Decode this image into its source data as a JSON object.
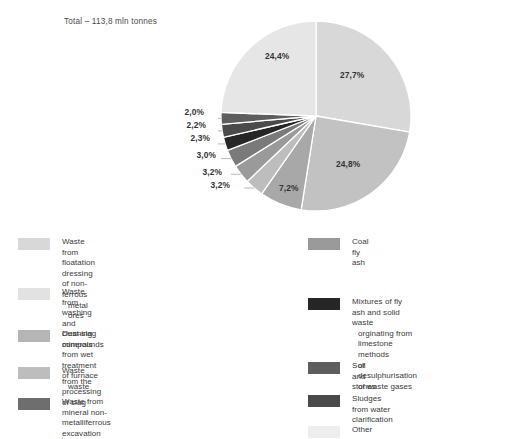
{
  "chart_data": {
    "type": "pie",
    "title": "Total – 113,8 mln tonnes",
    "total_label": "Total – 113,8 mln tonnes",
    "total_value": 113.8,
    "unit": "mln tonnes",
    "value_suffix": "%",
    "decimal_separator": ",",
    "legend_position": "bottom",
    "grid": false,
    "categories": [
      "Waste from floatation dressing of non-ferrous metal ores",
      "Coal fly ash",
      "Waste from washing and cleaning minerals",
      "Dust-slag compounds from wet treatment of furnace waste",
      "Waste from the processing of slag",
      "Waste from mineral non-metalliferrous excavation",
      "Mixtures of fly ash and solid waste orginating from limestone methods of desulphurisation of waste gases",
      "Soil and stones",
      "Sludges from water clarification",
      "Other"
    ],
    "values": [
      27.7,
      24.8,
      7.2,
      3.2,
      3.2,
      3.0,
      2.3,
      2.2,
      2.0,
      24.4
    ],
    "value_labels": [
      "27,7%",
      "24,8%",
      "7,2%",
      "3,2%",
      "3,2%",
      "3,0%",
      "2,3%",
      "2,2%",
      "2,0%",
      "24,4%"
    ],
    "colors": [
      "#d8d8d8",
      "#c2c2c2",
      "#a8a8a8",
      "#bdbdbd",
      "#9a9a9a",
      "#7a7a7a",
      "#262626",
      "#4a4a4a",
      "#5e5e5e",
      "#e6e6e6"
    ],
    "slices": [
      {
        "label": "27,7%",
        "value": 27.7,
        "color": "#d8d8d8",
        "legend": "Waste from floatation dressing of non-ferrous metal ores"
      },
      {
        "label": "24,8%",
        "value": 24.8,
        "color": "#c2c2c2",
        "legend": "Coal fly ash"
      },
      {
        "label": "7,2%",
        "value": 7.2,
        "color": "#a8a8a8",
        "legend": "Waste from washing and cleaning minerals"
      },
      {
        "label": "3,2%",
        "value": 3.2,
        "color": "#bdbdbd",
        "legend": "Dust-slag compounds from wet treatment of furnace waste"
      },
      {
        "label": "3,2%",
        "value": 3.2,
        "color": "#9a9a9a",
        "legend": "Waste from the processing of slag"
      },
      {
        "label": "3,0%",
        "value": 3.0,
        "color": "#7a7a7a",
        "legend": "Waste from mineral non-metalliferrous excavation"
      },
      {
        "label": "2,3%",
        "value": 2.3,
        "color": "#262626",
        "legend": "Mixtures of fly ash and solid waste orginating from limestone methods of desulphurisation of waste gases"
      },
      {
        "label": "2,2%",
        "value": 2.2,
        "color": "#4a4a4a",
        "legend": "Soil and stones"
      },
      {
        "label": "2,0%",
        "value": 2.0,
        "color": "#5e5e5e",
        "legend": "Sludges from water clarification"
      },
      {
        "label": "24,4%",
        "value": 24.4,
        "color": "#e6e6e6",
        "legend": "Other"
      }
    ]
  },
  "slice_labels": {
    "s1": "27,7%",
    "s2": "24,8%",
    "s3": "7,2%",
    "s4": "3,2%",
    "s5": "3,2%",
    "s6": "3,0%",
    "s7": "2,3%",
    "s8": "2,2%",
    "s9": "2,0%",
    "s10": "24,4%"
  },
  "legend": {
    "left": [
      {
        "color": "#d8d8d8",
        "line1": "Waste from floatation dressing of non-ferrous",
        "line2": "metal ores",
        "line3": ""
      },
      {
        "color": "#e2e2e2",
        "line1": "Waste from washing and cleaning minerals",
        "line2": "",
        "line3": ""
      },
      {
        "color": "#b5b5b5",
        "line1": "Dust-slag compounds from wet treatment of furnace",
        "line2": "waste",
        "line3": ""
      },
      {
        "color": "#bdbdbd",
        "line1": "Waste from the processing of slag",
        "line2": "",
        "line3": ""
      },
      {
        "color": "#6e6e6e",
        "line1": "Waste from mineral non-metalliferrous excavation",
        "line2": "",
        "line3": ""
      }
    ],
    "right": [
      {
        "color": "#9a9a9a",
        "line1": "Coal fly ash",
        "line2": "",
        "line3": ""
      },
      {
        "color": "#262626",
        "line1": "Mixtures of fly ash and solid waste",
        "line2": "orginating from limestone methods",
        "line3": "of desulphurisation of waste gases"
      },
      {
        "color": "#5e5e5e",
        "line1": "Soil and stones",
        "line2": "",
        "line3": ""
      },
      {
        "color": "#4a4a4a",
        "line1": "Sludges from water clarification",
        "line2": "",
        "line3": ""
      },
      {
        "color": "#ededed",
        "line1": "Other",
        "line2": "",
        "line3": ""
      }
    ]
  }
}
